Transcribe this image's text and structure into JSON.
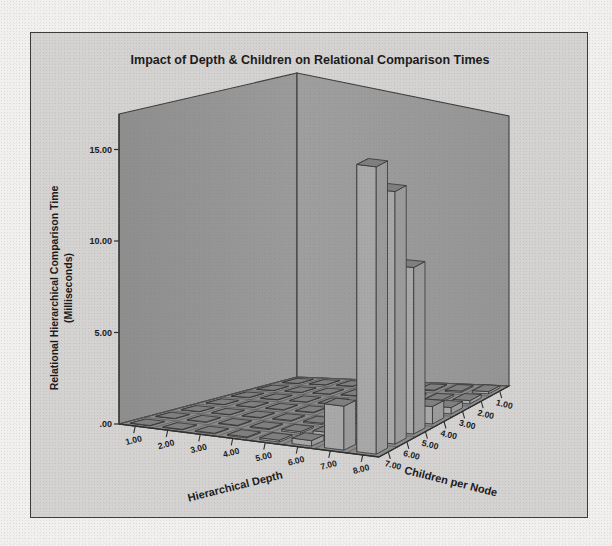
{
  "figure": {
    "title": "Impact of Depth & Children on Relational Comparison Times",
    "frame_color": "#3b3b3b",
    "background_color": "#d4d3d1",
    "wall_color": "#9c9c9c",
    "floor_color": "#8f8f8f",
    "bar_color": "#a8a8a8"
  },
  "axes": {
    "y_label_line1": "Relational Hierarchical Comparison Time",
    "y_label_line2": "(Milliseconds)",
    "x_label": "Hierarchical Depth",
    "z_label": "Children per Node",
    "y_ticks": [
      ".00",
      "5.00",
      "10.00",
      "15.00"
    ],
    "x_ticks": [
      "1.00",
      "2.00",
      "3.00",
      "4.00",
      "5.00",
      "6.00",
      "7.00",
      "8.00"
    ],
    "z_ticks": [
      "7.00",
      "6.00",
      "5.00",
      "4.00",
      "3.00",
      "2.00",
      "1.00"
    ]
  },
  "chart_data": {
    "type": "bar",
    "subtype": "bar3d",
    "title": "Impact of Depth & Children on Relational Comparison Times",
    "xlabel": "Hierarchical Depth",
    "zlabel": "Children per Node",
    "ylabel": "Relational Hierarchical Comparison Time (Milliseconds)",
    "ylim": [
      0,
      17
    ],
    "ytick_values": [
      0,
      5,
      10,
      15
    ],
    "grid": true,
    "legend": "none",
    "x_categories": [
      1,
      2,
      3,
      4,
      5,
      6,
      7,
      8
    ],
    "z_categories": [
      7,
      6,
      5,
      4,
      3,
      2,
      1
    ],
    "z_axis_reversed": true,
    "note": "values[z_index][x_index] in milliseconds; z order follows z_categories 7..1",
    "values": [
      [
        0.02,
        0.03,
        0.04,
        0.06,
        0.1,
        0.3,
        2.4,
        15.7
      ],
      [
        0.02,
        0.03,
        0.04,
        0.05,
        0.09,
        0.22,
        0.9,
        13.8
      ],
      [
        0.01,
        0.02,
        0.03,
        0.05,
        0.07,
        0.15,
        0.55,
        9.1
      ],
      [
        0.01,
        0.02,
        0.03,
        0.04,
        0.06,
        0.1,
        0.3,
        0.95
      ],
      [
        0.01,
        0.02,
        0.02,
        0.03,
        0.05,
        0.08,
        0.16,
        0.35
      ],
      [
        0.01,
        0.01,
        0.02,
        0.03,
        0.04,
        0.06,
        0.1,
        0.18
      ],
      [
        0.01,
        0.01,
        0.02,
        0.02,
        0.03,
        0.04,
        0.07,
        0.12
      ]
    ],
    "highlighted_bars": [
      {
        "depth": 8,
        "children": 7,
        "value": 15.7
      },
      {
        "depth": 8,
        "children": 6,
        "value": 13.8
      },
      {
        "depth": 8,
        "children": 5,
        "value": 9.1
      },
      {
        "depth": 7,
        "children": 7,
        "value": 2.4
      }
    ]
  }
}
